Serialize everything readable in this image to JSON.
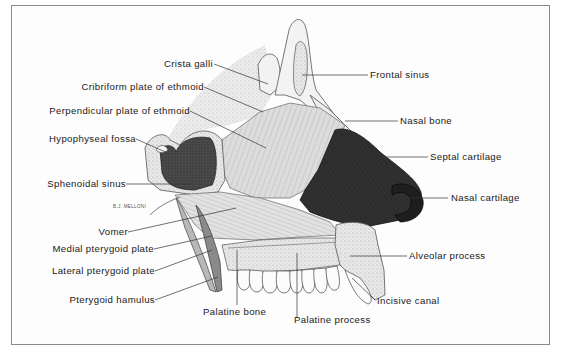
{
  "figure": {
    "signature": "B.J. MELLONI",
    "colors": {
      "frame": "#8a8a8a",
      "bone_light": "#e4e4e4",
      "bone_mid": "#c8c8c8",
      "septal_cartilage": "#2b2b2b",
      "sinus_dark": "#3a3a3a",
      "vomer": "#d0d0d0",
      "text": "#1a1a1a"
    },
    "labels_left": [
      {
        "id": "crista-galli",
        "text": "Crista galli"
      },
      {
        "id": "cribriform-plate",
        "text": "Cribriform plate of ethmoid"
      },
      {
        "id": "perpendicular-plate",
        "text": "Perpendicular plate of ethmoid"
      },
      {
        "id": "hypophyseal-fossa",
        "text": "Hypophyseal fossa"
      },
      {
        "id": "sphenoidal-sinus",
        "text": "Sphenoidal sinus"
      },
      {
        "id": "vomer",
        "text": "Vomer"
      },
      {
        "id": "medial-pterygoid-plate",
        "text": "Medial pterygoid plate"
      },
      {
        "id": "lateral-pterygoid-plate",
        "text": "Lateral pterygoid plate"
      },
      {
        "id": "pterygoid-hamulus",
        "text": "Pterygoid hamulus"
      }
    ],
    "labels_right": [
      {
        "id": "frontal-sinus",
        "text": "Frontal sinus"
      },
      {
        "id": "nasal-bone",
        "text": "Nasal bone"
      },
      {
        "id": "septal-cartilage",
        "text": "Septal cartilage"
      },
      {
        "id": "nasal-cartilage",
        "text": "Nasal cartilage"
      },
      {
        "id": "alveolar-process",
        "text": "Alveolar process"
      },
      {
        "id": "incisive-canal",
        "text": "Incisive canal"
      }
    ],
    "labels_bottom": [
      {
        "id": "palatine-bone",
        "text": "Palatine bone"
      },
      {
        "id": "palatine-process",
        "text": "Palatine process"
      }
    ]
  }
}
